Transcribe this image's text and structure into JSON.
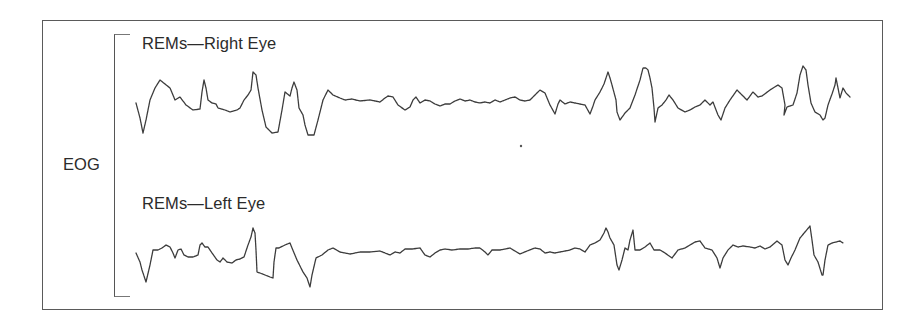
{
  "figure": {
    "group_label": "EOG",
    "channels": [
      {
        "label": "REMs—Right Eye"
      },
      {
        "label": "REMs—Left Eye"
      }
    ],
    "colors": {
      "trace": "#3c3c3c",
      "frame": "#5a5a5a",
      "text": "#2b2b2b",
      "background": "#ffffff"
    }
  },
  "chart_data": {
    "type": "line",
    "title": "",
    "group_label": "EOG",
    "xlabel": "",
    "ylabel": "",
    "grid": false,
    "legend_position": "none",
    "note": "Pixel-coordinate traces of electro-oculogram (EOG) rapid eye movements; y increases downward (screen space).",
    "series": [
      {
        "name": "REMs—Right Eye",
        "points": [
          [
            136,
            103
          ],
          [
            140,
            118
          ],
          [
            143,
            133
          ],
          [
            146,
            120
          ],
          [
            150,
            100
          ],
          [
            155,
            88
          ],
          [
            160,
            80
          ],
          [
            165,
            84
          ],
          [
            170,
            88
          ],
          [
            175,
            100
          ],
          [
            180,
            97
          ],
          [
            186,
            105
          ],
          [
            193,
            110
          ],
          [
            200,
            109
          ],
          [
            202,
            92
          ],
          [
            204,
            80
          ],
          [
            206,
            88
          ],
          [
            208,
            100
          ],
          [
            212,
            103
          ],
          [
            216,
            104
          ],
          [
            218,
            108
          ],
          [
            225,
            110
          ],
          [
            230,
            112
          ],
          [
            237,
            110
          ],
          [
            240,
            108
          ],
          [
            244,
            100
          ],
          [
            248,
            95
          ],
          [
            251,
            90
          ],
          [
            253,
            72
          ],
          [
            256,
            75
          ],
          [
            258,
            88
          ],
          [
            262,
            110
          ],
          [
            266,
            127
          ],
          [
            272,
            133
          ],
          [
            278,
            132
          ],
          [
            282,
            110
          ],
          [
            285,
            92
          ],
          [
            290,
            96
          ],
          [
            292,
            88
          ],
          [
            294,
            82
          ],
          [
            297,
            90
          ],
          [
            299,
            108
          ],
          [
            303,
            115
          ],
          [
            305,
            125
          ],
          [
            308,
            135
          ],
          [
            314,
            135
          ],
          [
            318,
            120
          ],
          [
            323,
            100
          ],
          [
            328,
            90
          ],
          [
            333,
            95
          ],
          [
            340,
            98
          ],
          [
            345,
            100
          ],
          [
            352,
            99
          ],
          [
            360,
            101
          ],
          [
            370,
            100
          ],
          [
            375,
            101
          ],
          [
            380,
            102
          ],
          [
            385,
            98
          ],
          [
            388,
            96
          ],
          [
            393,
            97
          ],
          [
            398,
            105
          ],
          [
            405,
            110
          ],
          [
            410,
            107
          ],
          [
            413,
            100
          ],
          [
            416,
            97
          ],
          [
            420,
            103
          ],
          [
            425,
            100
          ],
          [
            430,
            101
          ],
          [
            435,
            104
          ],
          [
            440,
            106
          ],
          [
            445,
            104
          ],
          [
            450,
            104
          ],
          [
            455,
            101
          ],
          [
            460,
            99
          ],
          [
            465,
            101
          ],
          [
            470,
            100
          ],
          [
            475,
            102
          ],
          [
            480,
            103
          ],
          [
            485,
            102
          ],
          [
            490,
            103
          ],
          [
            495,
            100
          ],
          [
            500,
            102
          ],
          [
            505,
            100
          ],
          [
            510,
            98
          ],
          [
            515,
            97
          ],
          [
            520,
            100
          ],
          [
            525,
            101
          ],
          [
            530,
            100
          ],
          [
            535,
            95
          ],
          [
            540,
            90
          ],
          [
            545,
            93
          ],
          [
            550,
            105
          ],
          [
            555,
            114
          ],
          [
            558,
            104
          ],
          [
            560,
            100
          ],
          [
            565,
            104
          ],
          [
            570,
            102
          ],
          [
            575,
            103
          ],
          [
            580,
            104
          ],
          [
            585,
            105
          ],
          [
            590,
            114
          ],
          [
            593,
            106
          ],
          [
            595,
            100
          ],
          [
            600,
            92
          ],
          [
            604,
            84
          ],
          [
            606,
            78
          ],
          [
            608,
            72
          ],
          [
            610,
            78
          ],
          [
            612,
            85
          ],
          [
            616,
            100
          ],
          [
            617,
            112
          ],
          [
            620,
            120
          ],
          [
            625,
            113
          ],
          [
            630,
            108
          ],
          [
            635,
            95
          ],
          [
            640,
            80
          ],
          [
            643,
            68
          ],
          [
            646,
            68
          ],
          [
            648,
            70
          ],
          [
            650,
            78
          ],
          [
            652,
            88
          ],
          [
            654,
            108
          ],
          [
            655,
            122
          ],
          [
            658,
            108
          ],
          [
            662,
            105
          ],
          [
            666,
            100
          ],
          [
            669,
            95
          ],
          [
            673,
            100
          ],
          [
            678,
            108
          ],
          [
            685,
            112
          ],
          [
            690,
            110
          ],
          [
            695,
            107
          ],
          [
            700,
            105
          ],
          [
            705,
            100
          ],
          [
            710,
            105
          ],
          [
            713,
            102
          ],
          [
            718,
            115
          ],
          [
            721,
            120
          ],
          [
            725,
            108
          ],
          [
            730,
            100
          ],
          [
            737,
            90
          ],
          [
            742,
            95
          ],
          [
            747,
            100
          ],
          [
            753,
            92
          ],
          [
            758,
            97
          ],
          [
            762,
            96
          ],
          [
            770,
            90
          ],
          [
            778,
            85
          ],
          [
            782,
            88
          ],
          [
            785,
            105
          ],
          [
            784,
            115
          ],
          [
            787,
            107
          ],
          [
            793,
            105
          ],
          [
            797,
            93
          ],
          [
            800,
            75
          ],
          [
            803,
            66
          ],
          [
            806,
            70
          ],
          [
            808,
            85
          ],
          [
            811,
            103
          ],
          [
            815,
            112
          ],
          [
            820,
            115
          ],
          [
            823,
            120
          ],
          [
            825,
            118
          ],
          [
            828,
            105
          ],
          [
            832,
            94
          ],
          [
            835,
            85
          ],
          [
            836,
            78
          ],
          [
            838,
            88
          ],
          [
            840,
            98
          ],
          [
            843,
            88
          ],
          [
            846,
            93
          ],
          [
            850,
            97
          ]
        ]
      },
      {
        "name": "REMs—Left Eye",
        "points": [
          [
            136,
            253
          ],
          [
            140,
            262
          ],
          [
            142,
            270
          ],
          [
            146,
            282
          ],
          [
            150,
            265
          ],
          [
            153,
            250
          ],
          [
            158,
            250
          ],
          [
            162,
            248
          ],
          [
            166,
            245
          ],
          [
            170,
            247
          ],
          [
            173,
            253
          ],
          [
            175,
            258
          ],
          [
            178,
            250
          ],
          [
            181,
            249
          ],
          [
            184,
            255
          ],
          [
            188,
            257
          ],
          [
            193,
            257
          ],
          [
            198,
            255
          ],
          [
            200,
            245
          ],
          [
            202,
            243
          ],
          [
            205,
            247
          ],
          [
            208,
            247
          ],
          [
            212,
            253
          ],
          [
            217,
            260
          ],
          [
            220,
            262
          ],
          [
            223,
            258
          ],
          [
            227,
            262
          ],
          [
            232,
            263
          ],
          [
            236,
            260
          ],
          [
            240,
            259
          ],
          [
            244,
            257
          ],
          [
            248,
            245
          ],
          [
            251,
            237
          ],
          [
            253,
            228
          ],
          [
            255,
            233
          ],
          [
            256,
            250
          ],
          [
            257,
            272
          ],
          [
            260,
            273
          ],
          [
            265,
            275
          ],
          [
            270,
            277
          ],
          [
            273,
            278
          ],
          [
            274,
            262
          ],
          [
            276,
            248
          ],
          [
            279,
            248
          ],
          [
            285,
            245
          ],
          [
            290,
            243
          ],
          [
            292,
            248
          ],
          [
            297,
            260
          ],
          [
            303,
            272
          ],
          [
            307,
            278
          ],
          [
            310,
            287
          ],
          [
            312,
            275
          ],
          [
            316,
            258
          ],
          [
            322,
            255
          ],
          [
            328,
            250
          ],
          [
            333,
            248
          ],
          [
            340,
            252
          ],
          [
            350,
            254
          ],
          [
            360,
            252
          ],
          [
            370,
            252
          ],
          [
            380,
            251
          ],
          [
            385,
            253
          ],
          [
            390,
            255
          ],
          [
            395,
            252
          ],
          [
            400,
            253
          ],
          [
            405,
            249
          ],
          [
            412,
            249
          ],
          [
            420,
            248
          ],
          [
            425,
            255
          ],
          [
            430,
            257
          ],
          [
            435,
            253
          ],
          [
            440,
            250
          ],
          [
            445,
            249
          ],
          [
            452,
            250
          ],
          [
            460,
            249
          ],
          [
            468,
            249
          ],
          [
            475,
            248
          ],
          [
            480,
            248
          ],
          [
            485,
            252
          ],
          [
            488,
            255
          ],
          [
            492,
            250
          ],
          [
            500,
            250
          ],
          [
            510,
            248
          ],
          [
            515,
            251
          ],
          [
            520,
            254
          ],
          [
            527,
            251
          ],
          [
            535,
            248
          ],
          [
            540,
            249
          ],
          [
            545,
            253
          ],
          [
            550,
            252
          ],
          [
            555,
            253
          ],
          [
            560,
            252
          ],
          [
            565,
            251
          ],
          [
            570,
            250
          ],
          [
            575,
            248
          ],
          [
            580,
            249
          ],
          [
            585,
            252
          ],
          [
            590,
            245
          ],
          [
            595,
            243
          ],
          [
            600,
            240
          ],
          [
            604,
            233
          ],
          [
            606,
            228
          ],
          [
            608,
            232
          ],
          [
            610,
            238
          ],
          [
            614,
            245
          ],
          [
            617,
            265
          ],
          [
            619,
            270
          ],
          [
            622,
            260
          ],
          [
            625,
            248
          ],
          [
            628,
            250
          ],
          [
            630,
            240
          ],
          [
            633,
            230
          ],
          [
            635,
            250
          ],
          [
            640,
            250
          ],
          [
            645,
            247
          ],
          [
            650,
            243
          ],
          [
            654,
            250
          ],
          [
            660,
            250
          ],
          [
            665,
            253
          ],
          [
            672,
            258
          ],
          [
            678,
            250
          ],
          [
            685,
            248
          ],
          [
            690,
            245
          ],
          [
            695,
            242
          ],
          [
            700,
            241
          ],
          [
            705,
            248
          ],
          [
            712,
            250
          ],
          [
            717,
            258
          ],
          [
            720,
            268
          ],
          [
            723,
            258
          ],
          [
            728,
            250
          ],
          [
            733,
            245
          ],
          [
            738,
            247
          ],
          [
            743,
            246
          ],
          [
            750,
            247
          ],
          [
            755,
            248
          ],
          [
            760,
            246
          ],
          [
            765,
            249
          ],
          [
            770,
            247
          ],
          [
            777,
            241
          ],
          [
            782,
            245
          ],
          [
            785,
            260
          ],
          [
            788,
            265
          ],
          [
            791,
            258
          ],
          [
            795,
            250
          ],
          [
            800,
            238
          ],
          [
            805,
            232
          ],
          [
            810,
            226
          ],
          [
            812,
            240
          ],
          [
            814,
            255
          ],
          [
            818,
            262
          ],
          [
            822,
            275
          ],
          [
            823,
            275
          ],
          [
            825,
            260
          ],
          [
            828,
            245
          ],
          [
            832,
            243
          ],
          [
            840,
            241
          ],
          [
            843,
            243
          ]
        ]
      }
    ]
  }
}
